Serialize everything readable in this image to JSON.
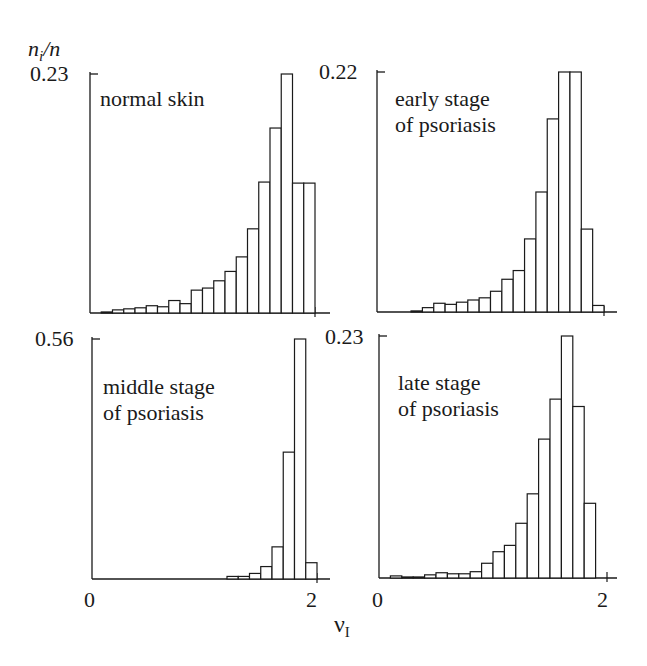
{
  "figure": {
    "ylabel": "n_i/n",
    "ylabel_main": "n",
    "ylabel_sub": "i",
    "ylabel_rest": "/n",
    "xlabel_main": "ν",
    "xlabel_sub": "I",
    "line_color": "#1a1a1a",
    "background": "#ffffff"
  },
  "chart_data": [
    {
      "type": "bar",
      "title": "normal skin",
      "xlabel": "ν_I",
      "ylabel": "n_i/n",
      "xlim": [
        0,
        2
      ],
      "ylim": [
        0,
        0.23
      ],
      "y_tick_label": "0.23",
      "x_tick_labels": [],
      "bin_width": 0.1,
      "bin_starts": [
        0.1,
        0.2,
        0.3,
        0.4,
        0.5,
        0.6,
        0.7,
        0.8,
        0.9,
        1.0,
        1.1,
        1.2,
        1.3,
        1.4,
        1.5,
        1.6,
        1.7,
        1.8,
        1.9
      ],
      "values": [
        0.001,
        0.003,
        0.004,
        0.005,
        0.007,
        0.006,
        0.012,
        0.009,
        0.022,
        0.024,
        0.031,
        0.04,
        0.054,
        0.081,
        0.126,
        0.178,
        0.23,
        0.125,
        0.125
      ],
      "grid": false
    },
    {
      "type": "bar",
      "title": "early stage\nof psoriasis",
      "xlabel": "ν_I",
      "ylabel": "n_i/n",
      "xlim": [
        0,
        2
      ],
      "ylim": [
        0,
        0.22
      ],
      "y_tick_label": "0.22",
      "x_tick_labels": [],
      "bin_width": 0.1,
      "bin_starts": [
        0.3,
        0.4,
        0.5,
        0.6,
        0.7,
        0.8,
        0.9,
        1.0,
        1.1,
        1.2,
        1.3,
        1.4,
        1.5,
        1.6,
        1.7,
        1.8,
        1.9
      ],
      "values": [
        0.001,
        0.004,
        0.008,
        0.007,
        0.009,
        0.011,
        0.013,
        0.019,
        0.03,
        0.038,
        0.067,
        0.11,
        0.177,
        0.22,
        0.22,
        0.076,
        0.006
      ],
      "grid": false
    },
    {
      "type": "bar",
      "title": "middle stage\nof psoriasis",
      "xlabel": "ν_I",
      "ylabel": "n_i/n",
      "xlim": [
        0,
        2
      ],
      "ylim": [
        0,
        0.56
      ],
      "y_tick_label": "0.56",
      "x_tick_labels": [
        "0",
        "2"
      ],
      "bin_width": 0.1,
      "bin_starts": [
        1.2,
        1.3,
        1.4,
        1.5,
        1.6,
        1.7,
        1.8,
        1.9
      ],
      "values": [
        0.006,
        0.006,
        0.013,
        0.029,
        0.075,
        0.296,
        0.56,
        0.038
      ],
      "grid": false
    },
    {
      "type": "bar",
      "title": "late stage\nof psoriasis",
      "xlabel": "ν_I",
      "ylabel": "n_i/n",
      "xlim": [
        0,
        2
      ],
      "ylim": [
        0,
        0.23
      ],
      "y_tick_label": "0.23",
      "x_tick_labels": [
        "0",
        "2"
      ],
      "bin_width": 0.1,
      "bin_starts": [
        0.1,
        0.2,
        0.3,
        0.4,
        0.5,
        0.6,
        0.7,
        0.8,
        0.9,
        1.0,
        1.1,
        1.2,
        1.3,
        1.4,
        1.5,
        1.6,
        1.7,
        1.8
      ],
      "values": [
        0.002,
        0.001,
        0.001,
        0.003,
        0.005,
        0.004,
        0.004,
        0.006,
        0.014,
        0.025,
        0.031,
        0.052,
        0.08,
        0.132,
        0.17,
        0.23,
        0.163,
        0.071
      ],
      "grid": false
    }
  ]
}
